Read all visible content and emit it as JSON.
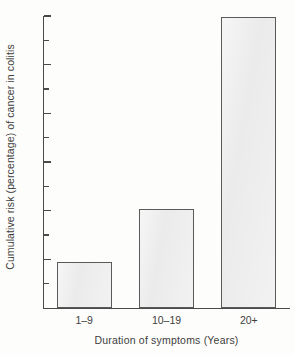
{
  "chart_data": {
    "type": "bar",
    "title": "",
    "categories": [
      "1–9",
      "10–19",
      "20+"
    ],
    "values": [
      0.95,
      2.03,
      5.97
    ],
    "xlabel": "Duration of symptoms (Years)",
    "ylabel": "Cumulative risk (percentage) of cancer in colitis",
    "ylim": [
      0,
      6
    ],
    "xlim": [
      0,
      3
    ],
    "ytick_labels": [
      "1",
      "2",
      "3",
      "4",
      "5",
      "6"
    ],
    "ytick_values": [
      1,
      2,
      3,
      4,
      5,
      6
    ],
    "yminor_tick_values": [
      0.5,
      1.5,
      2.5,
      3.5,
      4.5,
      5.5
    ],
    "grid": false,
    "legend": null,
    "bar_fill_color": "#ebebeb",
    "bar_border_color": "#5a5a5a",
    "axis_color": "#4a4a4a",
    "background_color": "#fdfdfc",
    "series": [
      {
        "name": "Cumulative risk",
        "values": [
          0.95,
          2.03,
          5.97
        ]
      }
    ]
  }
}
